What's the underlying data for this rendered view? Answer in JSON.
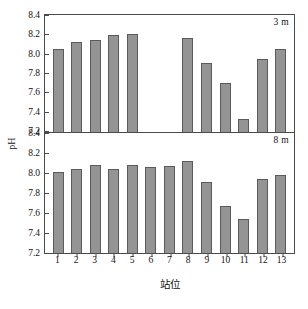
{
  "chart_data": {
    "type": "bar",
    "title": "",
    "xlabel": "站位",
    "ylabel": "pH",
    "categories": [
      "1",
      "2",
      "3",
      "4",
      "5",
      "6",
      "7",
      "8",
      "9",
      "10",
      "11",
      "12",
      "13"
    ],
    "panels": [
      {
        "label": "3 m",
        "ylim": [
          7.2,
          8.4
        ],
        "yticks": [
          "8.4",
          "8.2",
          "8.0",
          "7.8",
          "7.6",
          "7.4",
          "7.2"
        ],
        "ytick_values": [
          8.4,
          8.2,
          8.0,
          7.8,
          7.6,
          7.4,
          7.2
        ],
        "values": [
          8.06,
          8.13,
          8.15,
          8.2,
          8.21,
          null,
          null,
          8.17,
          7.91,
          7.71,
          7.33,
          7.96,
          8.06
        ]
      },
      {
        "label": "8 m",
        "ylim": [
          7.2,
          8.4
        ],
        "yticks": [
          "8.4",
          "8.2",
          "8.0",
          "7.8",
          "7.6",
          "7.4",
          "7.2"
        ],
        "ytick_values": [
          8.4,
          8.2,
          8.0,
          7.8,
          7.6,
          7.4,
          7.2
        ],
        "values": [
          8.01,
          8.04,
          8.08,
          8.04,
          8.08,
          8.06,
          8.07,
          8.12,
          7.91,
          7.67,
          7.54,
          7.94,
          7.98
        ]
      }
    ],
    "grid": false,
    "legend": "none",
    "bar_color": "#949494",
    "bar_edge_color": "#5b5b5b",
    "axis_color": "#4a4a4a",
    "background": "#ffffff"
  }
}
